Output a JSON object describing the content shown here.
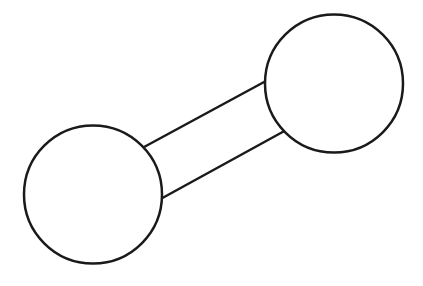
{
  "diagram": {
    "type": "two-node-connection",
    "background": "#ffffff",
    "stroke_color": "#1a1a1a",
    "stroke_width": 2.5,
    "nodes": [
      {
        "id": "left-node",
        "cx": 93,
        "cy": 194.5,
        "r": 69
      },
      {
        "id": "right-node",
        "cx": 334,
        "cy": 83.5,
        "r": 69
      }
    ],
    "connectors": [
      {
        "id": "upper-edge",
        "x1": 145,
        "y1": 146.5,
        "x2": 265,
        "y2": 81.5
      },
      {
        "id": "lower-edge",
        "x1": 161.5,
        "y1": 198.5,
        "x2": 283.5,
        "y2": 131.5
      }
    ]
  }
}
